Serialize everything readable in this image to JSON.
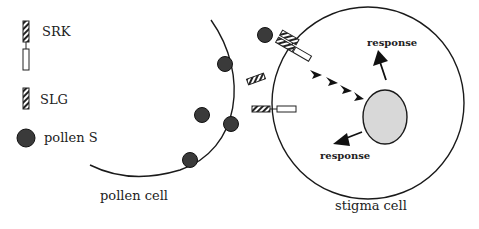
{
  "legend": {
    "items": [
      {
        "icon": "srk-receptor-icon",
        "label": "SRK"
      },
      {
        "icon": "slg-glycoprotein-icon",
        "label": "SLG"
      },
      {
        "icon": "pollen-s-icon",
        "label": "pollen S"
      }
    ]
  },
  "cells": {
    "pollen": {
      "label": "pollen cell"
    },
    "stigma": {
      "label": "stigma cell"
    }
  },
  "responses": [
    {
      "label": "response"
    },
    {
      "label": "response"
    }
  ],
  "colors": {
    "outline": "#1a1a1a",
    "pollen_s_fill": "#3a3a3a",
    "nucleus_fill": "#d8d8d8"
  }
}
